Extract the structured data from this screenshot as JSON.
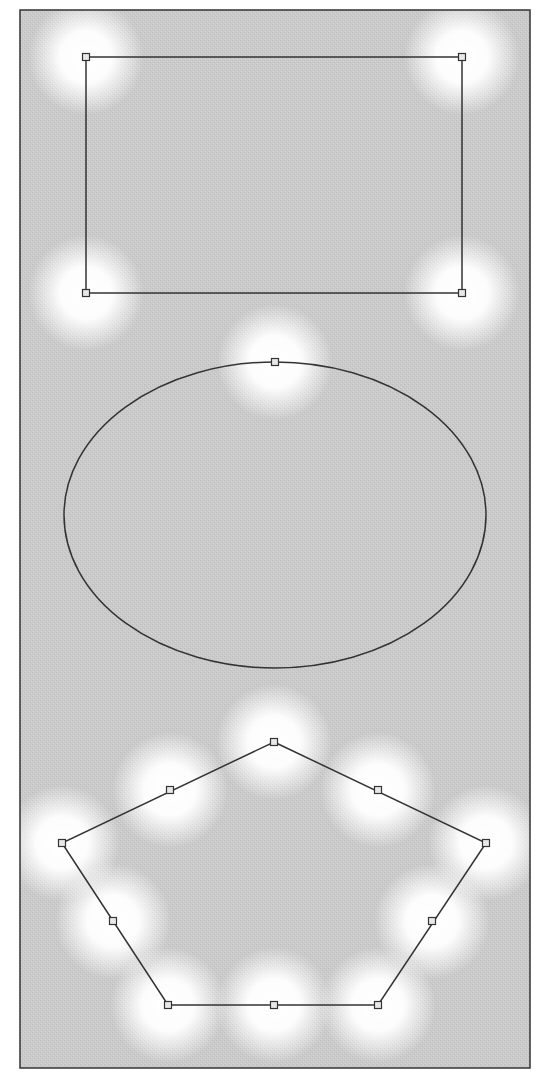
{
  "canvas": {
    "width": 546,
    "height": 1078,
    "frame": {
      "x": 20,
      "y": 10,
      "w": 510,
      "h": 1058
    },
    "colors": {
      "background": "#ffffff",
      "canvas_fill": "#c9c9c9",
      "glow": "#ffffff",
      "stroke": "#333333",
      "handle_fill": "#e8e8e8"
    }
  },
  "shapes": [
    {
      "type": "rectangle",
      "name": "rectangle",
      "x": 86,
      "y": 57,
      "w": 376,
      "h": 236,
      "handles": [
        [
          86,
          57
        ],
        [
          462,
          57
        ],
        [
          86,
          293
        ],
        [
          462,
          293
        ]
      ]
    },
    {
      "type": "ellipse",
      "name": "ellipse",
      "cx": 275,
      "cy": 515,
      "rx": 211,
      "ry": 153,
      "handles": [
        [
          275,
          362
        ]
      ]
    },
    {
      "type": "polygon",
      "name": "pentagon",
      "points": [
        [
          274,
          742
        ],
        [
          486,
          843
        ],
        [
          378,
          1005
        ],
        [
          168,
          1005
        ],
        [
          62,
          843
        ]
      ],
      "handles": [
        [
          274,
          742
        ],
        [
          378,
          790
        ],
        [
          486,
          843
        ],
        [
          432,
          921
        ],
        [
          378,
          1005
        ],
        [
          274,
          1005
        ],
        [
          168,
          1005
        ],
        [
          113,
          921
        ],
        [
          62,
          843
        ],
        [
          170,
          790
        ]
      ]
    }
  ],
  "glows": [
    [
      86,
      57
    ],
    [
      462,
      57
    ],
    [
      86,
      293
    ],
    [
      462,
      293
    ],
    [
      275,
      362
    ],
    [
      274,
      742
    ],
    [
      170,
      790
    ],
    [
      378,
      790
    ],
    [
      62,
      843
    ],
    [
      486,
      843
    ],
    [
      113,
      921
    ],
    [
      432,
      921
    ],
    [
      168,
      1005
    ],
    [
      274,
      1005
    ],
    [
      378,
      1005
    ]
  ]
}
